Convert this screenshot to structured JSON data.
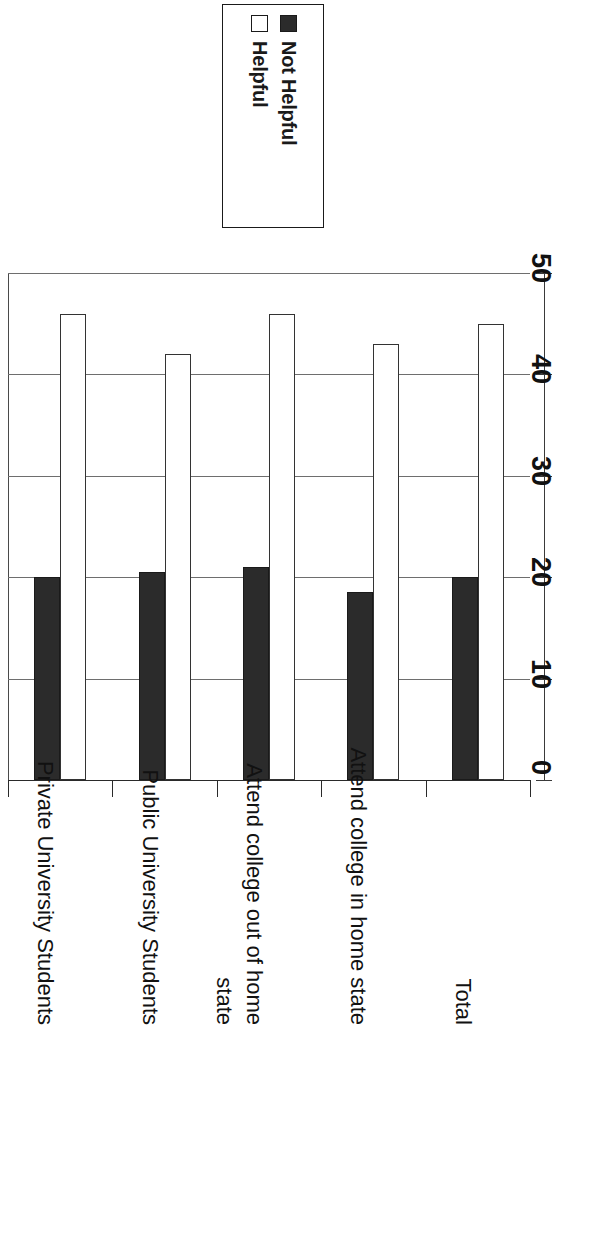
{
  "chart_data": {
    "type": "bar",
    "title": "",
    "subtitle": "",
    "xlabel": "",
    "ylabel": "",
    "orientation": "rotated-90",
    "grid": true,
    "legend_position": "top",
    "categories": [
      "Private University Students",
      "Public University Students",
      "Attend college out of home\nstate",
      "Attend college in home state",
      "Total"
    ],
    "series": [
      {
        "name": "Not Helpful",
        "color": "#2b2b2b",
        "values": [
          20,
          20.5,
          21,
          18.5,
          20
        ]
      },
      {
        "name": "Helpful",
        "color": "#ffffff",
        "values": [
          46,
          42,
          46,
          43,
          45
        ]
      }
    ],
    "ylim": [
      0,
      50
    ],
    "yticks": [
      0,
      10,
      20,
      30,
      40,
      50
    ],
    "ytick_labels": [
      "0",
      "10",
      "20",
      "30",
      "40",
      "50"
    ]
  },
  "legend": {
    "entries": [
      {
        "label": "Not Helpful",
        "swatch": "filled-square-icon"
      },
      {
        "label": "Helpful",
        "swatch": "hollow-square-icon"
      }
    ]
  }
}
